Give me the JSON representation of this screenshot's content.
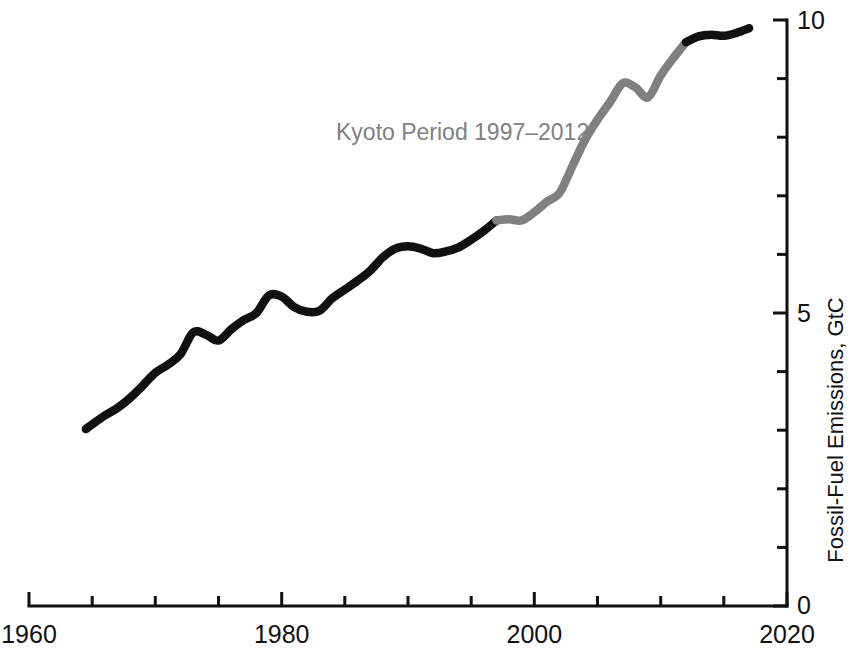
{
  "chart_data": {
    "type": "line",
    "title": "",
    "subtitle": "",
    "xlabel": "",
    "ylabel": "Fossil-Fuel Emissions, GtC",
    "xlim": [
      1960,
      2020
    ],
    "ylim": [
      0,
      10
    ],
    "grid": false,
    "legend_position": "none",
    "x_ticks_major": [
      1960,
      1980,
      2000,
      2020
    ],
    "x_tick_labels": [
      "1960",
      "1980",
      "2000",
      "2020"
    ],
    "x_ticks_minor": [
      1965,
      1970,
      1975,
      1985,
      1990,
      1995,
      2005,
      2010,
      2015
    ],
    "y_ticks_major": [
      0,
      5,
      10
    ],
    "y_tick_labels": [
      "0",
      "5",
      "10"
    ],
    "y_ticks_minor": [
      1,
      2,
      3,
      4,
      6,
      7,
      8,
      9
    ],
    "y_axis_side": "right",
    "annotations": [
      {
        "text": "Kyoto Period 1997–2012",
        "x": 1989.5,
        "y": 7.75,
        "color": "#808080"
      }
    ],
    "series": [
      {
        "name": "Fossil-Fuel Emissions",
        "color_pre_kyoto": "#111111",
        "color_kyoto": "#808080",
        "kyoto_start": 1997,
        "kyoto_end": 2012,
        "x": [
          1964.5,
          1965,
          1966,
          1967,
          1968,
          1969,
          1970,
          1971,
          1972,
          1973,
          1974,
          1975,
          1976,
          1977,
          1978,
          1979,
          1980,
          1981,
          1982,
          1983,
          1984,
          1985,
          1986,
          1987,
          1988,
          1989,
          1990,
          1991,
          1992,
          1993,
          1994,
          1995,
          1996,
          1997,
          1998,
          1999,
          2000,
          2001,
          2002,
          2003,
          2004,
          2005,
          2006,
          2007,
          2008,
          2009,
          2010,
          2011,
          2012,
          2013,
          2014,
          2015,
          2016,
          2017
        ],
        "values": [
          3.02,
          3.1,
          3.25,
          3.38,
          3.55,
          3.76,
          3.98,
          4.12,
          4.3,
          4.67,
          4.63,
          4.53,
          4.72,
          4.88,
          5.0,
          5.3,
          5.28,
          5.1,
          5.02,
          5.04,
          5.25,
          5.4,
          5.55,
          5.72,
          5.95,
          6.1,
          6.14,
          6.1,
          6.02,
          6.05,
          6.12,
          6.25,
          6.4,
          6.58,
          6.6,
          6.58,
          6.72,
          6.9,
          7.05,
          7.5,
          7.95,
          8.3,
          8.6,
          8.92,
          8.85,
          8.68,
          9.05,
          9.35,
          9.62,
          9.72,
          9.75,
          9.73,
          9.78,
          9.86
        ]
      }
    ]
  },
  "axes": {
    "x_axis_name": "year-axis",
    "y_axis_name": "emissions-axis"
  }
}
